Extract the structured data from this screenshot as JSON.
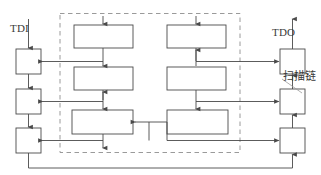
{
  "diagram": {
    "type": "block-diagram",
    "colors": {
      "line": "#4a4a4a",
      "dashed_border": "#9a9a9a",
      "block_fill": "#ffffff",
      "text": "#3a3a3a",
      "background": "#ffffff"
    },
    "labels": {
      "tdi": "TDI",
      "tdo": "TDO",
      "scan_chain": "扫描链"
    },
    "scan_cells_left": [
      {
        "id": "scan-cell-left-1"
      },
      {
        "id": "scan-cell-left-2"
      },
      {
        "id": "scan-cell-left-3"
      }
    ],
    "scan_cells_right": [
      {
        "id": "scan-cell-right-1"
      },
      {
        "id": "scan-cell-right-2"
      },
      {
        "id": "scan-cell-right-3"
      }
    ],
    "logic_blocks_left": [
      {
        "id": "logic-block-left-1"
      },
      {
        "id": "logic-block-left-2"
      },
      {
        "id": "logic-block-left-3"
      }
    ],
    "logic_blocks_right": [
      {
        "id": "logic-block-right-1"
      },
      {
        "id": "logic-block-right-2"
      },
      {
        "id": "logic-block-right-3"
      }
    ],
    "core_boundary": {
      "id": "core-boundary-dashed"
    }
  }
}
